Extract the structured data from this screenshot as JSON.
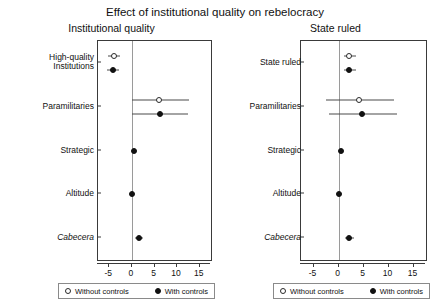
{
  "chart_data": {
    "type": "scatter",
    "title": "Effect of institutional quality on rebelocracy",
    "xlabel": "",
    "ylabel": "",
    "xlim": [
      -7.5,
      17.5
    ],
    "xticks": [
      -5,
      0,
      5,
      10,
      15
    ],
    "xticklabels": [
      "-5",
      "0",
      "5",
      "10",
      "15"
    ],
    "grid": false,
    "reference_line": 0,
    "legend": {
      "position": "bottom",
      "entries": [
        {
          "label": "Without controls",
          "marker": "open-circle"
        },
        {
          "label": "With controls",
          "marker": "filled-circle"
        }
      ]
    },
    "panels": [
      {
        "subtitle": "Institutional quality",
        "categories": [
          "High-quality\nInstitutions",
          "Paramilitaries",
          "Strategic",
          "Altitude",
          "Cabecera"
        ],
        "italic_categories": [
          "Cabecera"
        ],
        "series": [
          {
            "name": "Without controls",
            "marker": "open-circle",
            "values": [
              -3.9,
              6.1,
              null,
              null,
              null
            ],
            "ci_low": [
              -5.2,
              0.0,
              null,
              null,
              null
            ],
            "ci_high": [
              -2.6,
              12.6,
              null,
              null,
              null
            ]
          },
          {
            "name": "With controls",
            "marker": "filled-circle",
            "values": [
              -4.1,
              6.2,
              0.4,
              0.1,
              1.5
            ],
            "ci_low": [
              -5.4,
              0.0,
              0.3,
              0.0,
              0.7
            ],
            "ci_high": [
              -2.8,
              12.4,
              0.5,
              0.2,
              2.4
            ]
          }
        ]
      },
      {
        "subtitle": "State ruled",
        "categories": [
          "State ruled",
          "Paramilitaries",
          "Strategic",
          "Altitude",
          "Cabecera"
        ],
        "italic_categories": [
          "Cabecera"
        ],
        "series": [
          {
            "name": "Without controls",
            "marker": "open-circle",
            "values": [
              2.1,
              4.0,
              null,
              null,
              null
            ],
            "ci_low": [
              1.0,
              -2.5,
              null,
              null,
              null
            ],
            "ci_high": [
              3.5,
              11.0,
              null,
              null,
              null
            ]
          },
          {
            "name": "With controls",
            "marker": "filled-circle",
            "values": [
              2.1,
              4.7,
              0.4,
              0.1,
              2.1
            ],
            "ci_low": [
              1.0,
              -2.0,
              0.3,
              0.0,
              1.2
            ],
            "ci_high": [
              3.4,
              11.6,
              0.5,
              0.2,
              3.0
            ]
          }
        ]
      }
    ]
  },
  "title": "Effect of institutional quality on rebelocracy",
  "left": {
    "subtitle": "Institutional quality",
    "ylabels": [
      "High-quality\nInstitutions",
      "Paramilitaries",
      "Strategic",
      "Altitude",
      "Cabecera"
    ],
    "xticklabels": [
      "-5",
      "0",
      "5",
      "10",
      "15"
    ],
    "legend": {
      "without": "Without controls",
      "with": "With controls"
    }
  },
  "right": {
    "subtitle": "State ruled",
    "ylabels": [
      "State ruled",
      "Paramilitaries",
      "Strategic",
      "Altitude",
      "Cabecera"
    ],
    "xticklabels": [
      "-5",
      "0",
      "5",
      "10",
      "15"
    ],
    "legend": {
      "without": "Without controls",
      "with": "With controls"
    }
  }
}
